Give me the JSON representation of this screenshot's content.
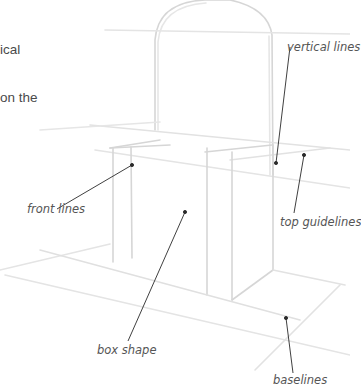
{
  "intro_text": {
    "lines": [
      "ical",
      "",
      "on the"
    ]
  },
  "labels": {
    "vertical_lines": "vertical lines",
    "front_lines": "front lines",
    "top_guidelines": "top guidelines",
    "box_shape": "box shape",
    "baselines": "baselines"
  },
  "colors": {
    "sketch_line": "#d9d9d9",
    "leader_line": "#2a2a2a",
    "label_text": "#555555"
  }
}
